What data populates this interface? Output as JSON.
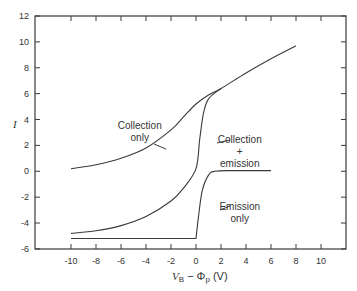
{
  "chart_data": {
    "type": "line",
    "title": "",
    "xlabel": "V_B − Φ_p (V)",
    "ylabel": "I",
    "xlim": [
      -12,
      12
    ],
    "ylim": [
      -6,
      12
    ],
    "x_ticks": [
      -10,
      -8,
      -6,
      -4,
      -2,
      0,
      2,
      4,
      6,
      8,
      10
    ],
    "y_ticks": [
      -6,
      -4,
      -2,
      0,
      2,
      4,
      6,
      8,
      10,
      12
    ],
    "grid": false,
    "legend": "none (inline annotations)",
    "series": [
      {
        "name": "Collection only",
        "x": [
          -10,
          -8,
          -6,
          -4,
          -2,
          -1,
          0,
          1,
          2,
          4,
          6,
          8
        ],
        "y": [
          0.2,
          0.5,
          1.0,
          1.8,
          3.2,
          4.2,
          5.2,
          5.9,
          6.4,
          7.6,
          8.7,
          9.7
        ]
      },
      {
        "name": "Collection + emission",
        "x": [
          -10,
          -8,
          -6,
          -4,
          -2,
          -1,
          0,
          0.3,
          0.6,
          1,
          2
        ],
        "y": [
          -4.8,
          -4.6,
          -4.2,
          -3.5,
          -2.3,
          -1.3,
          0.2,
          2.5,
          4.5,
          5.6,
          6.4
        ]
      },
      {
        "name": "Emission only",
        "x": [
          -10,
          0,
          0.2,
          0.5,
          1,
          1.5,
          3,
          6
        ],
        "y": [
          -5.2,
          -5.2,
          -3.5,
          -1.5,
          -0.3,
          0,
          0.05,
          0.05
        ]
      }
    ],
    "annotations": [
      {
        "text_lines": [
          "Collection",
          "only"
        ],
        "x": -4.5,
        "y": 3.3
      },
      {
        "text_lines": [
          "Collection",
          "+",
          "emission"
        ],
        "x": 3.5,
        "y": 2.2
      },
      {
        "text_lines": [
          "Emission",
          "only"
        ],
        "x": 3.5,
        "y": -3.0
      }
    ]
  },
  "labels": {
    "ylabel": "I",
    "xlabel_main": "V",
    "xlabel_sub": "B",
    "xlabel_rest": " − Φ",
    "xlabel_sub2": "p",
    "xlabel_unit": " (V)"
  }
}
